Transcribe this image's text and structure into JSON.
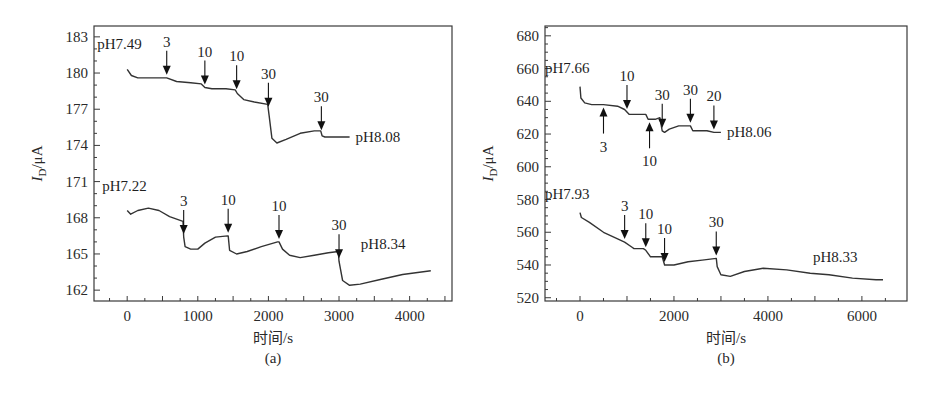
{
  "chart_data": [
    {
      "id": "a",
      "type": "line",
      "panel_label": "(a)",
      "title": "",
      "xlabel": "时间/s",
      "ylabel": "I_D/μA",
      "ylabel_main": "I",
      "ylabel_sub": "D",
      "ylabel_unit": "/μA",
      "xlim": [
        -470,
        4600
      ],
      "ylim": [
        161.1,
        183.9
      ],
      "xticks": [
        0,
        1000,
        2000,
        3000,
        4000
      ],
      "yticks": [
        162,
        165,
        168,
        171,
        174,
        177,
        180,
        183
      ],
      "x_minor_step": 250,
      "y_minor_step": 1,
      "grid": false,
      "series": [
        {
          "name": "pH7.49 → pH8.08",
          "start_label": "pH7.49",
          "end_label": "pH8.08",
          "x": [
            0,
            60,
            150,
            300,
            560,
            700,
            900,
            1050,
            1100,
            1200,
            1400,
            1530,
            1560,
            1650,
            1800,
            1990,
            2010,
            2050,
            2120,
            2250,
            2450,
            2650,
            2740,
            2760,
            2800,
            3000,
            3150
          ],
          "y": [
            180.3,
            179.8,
            179.6,
            179.6,
            179.6,
            179.3,
            179.2,
            179.1,
            178.8,
            178.7,
            178.7,
            178.6,
            178.3,
            177.8,
            177.6,
            177.4,
            176.5,
            174.6,
            174.2,
            174.5,
            175.0,
            175.2,
            175.2,
            174.8,
            174.7,
            174.7,
            174.7
          ]
        },
        {
          "name": "pH7.22 → pH8.34",
          "start_label": "pH7.22",
          "end_label": "pH8.34",
          "x": [
            0,
            50,
            150,
            300,
            450,
            600,
            790,
            800,
            820,
            900,
            1000,
            1100,
            1250,
            1420,
            1430,
            1450,
            1550,
            1700,
            1900,
            2130,
            2150,
            2200,
            2300,
            2450,
            2650,
            2850,
            2990,
            3000,
            3050,
            3150,
            3300,
            3600,
            3900,
            4300
          ],
          "y": [
            168.6,
            168.3,
            168.6,
            168.8,
            168.6,
            168.1,
            167.7,
            166.4,
            165.6,
            165.4,
            165.4,
            165.9,
            166.4,
            166.5,
            166.5,
            165.3,
            165.0,
            165.2,
            165.6,
            166.0,
            166.0,
            165.4,
            164.9,
            164.7,
            164.9,
            165.1,
            165.2,
            164.4,
            162.8,
            162.4,
            162.5,
            162.9,
            163.3,
            163.6
          ]
        }
      ],
      "annotations": [
        {
          "text": "3",
          "x": 560,
          "series": 0,
          "dir": "down"
        },
        {
          "text": "10",
          "x": 1100,
          "series": 0,
          "dir": "down"
        },
        {
          "text": "10",
          "x": 1550,
          "series": 0,
          "dir": "down"
        },
        {
          "text": "30",
          "x": 2000,
          "series": 0,
          "dir": "down"
        },
        {
          "text": "30",
          "x": 2750,
          "series": 0,
          "dir": "down"
        },
        {
          "text": "3",
          "x": 800,
          "series": 1,
          "dir": "down"
        },
        {
          "text": "10",
          "x": 1430,
          "series": 1,
          "dir": "down"
        },
        {
          "text": "10",
          "x": 2150,
          "series": 1,
          "dir": "down"
        },
        {
          "text": "30",
          "x": 3000,
          "series": 1,
          "dir": "down"
        }
      ]
    },
    {
      "id": "b",
      "type": "line",
      "panel_label": "(b)",
      "title": "",
      "xlabel": "时间/s",
      "ylabel": "I_D/μA",
      "ylabel_main": "I",
      "ylabel_sub": "D",
      "ylabel_unit": "/μA",
      "xlim": [
        -745,
        6960
      ],
      "ylim": [
        518,
        686
      ],
      "xticks": [
        0,
        2000,
        4000,
        6000
      ],
      "yticks": [
        520,
        540,
        560,
        580,
        600,
        620,
        640,
        660,
        680
      ],
      "x_minor_step": 500,
      "y_minor_step": 5,
      "grid": false,
      "series": [
        {
          "name": "pH7.66 → pH8.06",
          "start_label": "pH7.66",
          "end_label": "pH8.06",
          "x": [
            0,
            20,
            100,
            250,
            500,
            800,
            950,
            1050,
            1150,
            1400,
            1450,
            1500,
            1600,
            1700,
            1750,
            1800,
            1900,
            2100,
            2350,
            2400,
            2500,
            2700,
            2850,
            2900,
            3000
          ],
          "y": [
            649,
            642,
            639,
            638,
            638,
            637,
            635,
            632,
            632,
            632,
            629,
            629,
            629,
            630,
            622,
            621,
            623,
            625,
            625,
            622,
            622,
            622,
            621,
            621,
            621
          ]
        },
        {
          "name": "pH7.93 → pH8.33",
          "start_label": "pH7.93",
          "end_label": "pH8.33",
          "x": [
            0,
            30,
            200,
            500,
            800,
            950,
            1100,
            1150,
            1350,
            1400,
            1500,
            1600,
            1750,
            1800,
            2000,
            2300,
            2600,
            2900,
            2920,
            3000,
            3200,
            3500,
            3900,
            4400,
            4900,
            5300,
            5800,
            6300,
            6450
          ],
          "y": [
            572,
            569,
            566,
            560,
            556,
            554,
            551,
            550,
            550,
            549,
            545,
            545,
            545,
            540,
            540,
            542,
            543,
            544,
            539,
            534,
            533,
            536,
            538,
            537,
            535,
            534,
            532,
            531,
            531
          ]
        }
      ],
      "annotations": [
        {
          "text": "10",
          "x": 1000,
          "series": 0,
          "dir": "down"
        },
        {
          "text": "30",
          "x": 1750,
          "series": 0,
          "dir": "down"
        },
        {
          "text": "30",
          "x": 2350,
          "series": 0,
          "dir": "down"
        },
        {
          "text": "20",
          "x": 2850,
          "series": 0,
          "dir": "down"
        },
        {
          "text": "3",
          "x": 500,
          "series": 0,
          "dir": "up"
        },
        {
          "text": "10",
          "x": 1480,
          "series": 0,
          "dir": "up"
        },
        {
          "text": "3",
          "x": 950,
          "series": 1,
          "dir": "down"
        },
        {
          "text": "10",
          "x": 1400,
          "series": 1,
          "dir": "down"
        },
        {
          "text": "10",
          "x": 1800,
          "series": 1,
          "dir": "down"
        },
        {
          "text": "30",
          "x": 2900,
          "series": 1,
          "dir": "down"
        }
      ]
    }
  ],
  "layout": {
    "panels": [
      {
        "frame": {
          "x": 94,
          "y": 26,
          "w": 358,
          "h": 275
        }
      },
      {
        "frame": {
          "x": 545,
          "y": 26,
          "w": 362,
          "h": 275
        }
      }
    ]
  },
  "colors": {
    "line": "#333333",
    "frame": "#3a3a3a",
    "text": "#2a2a2a",
    "background": "#ffffff"
  }
}
